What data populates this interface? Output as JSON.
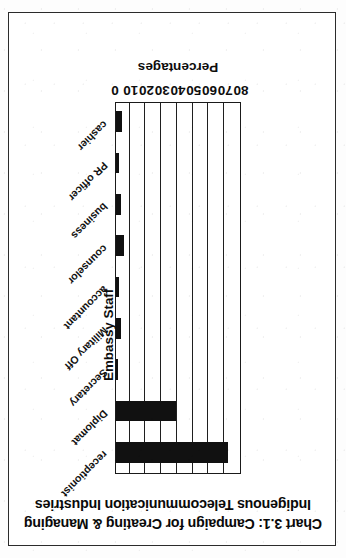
{
  "figure": {
    "caption_prefix": "Chart 3.1:",
    "title_line_1": "Chart 3.1: Campaign for Creating & Managing",
    "title_line_2": "Indigenous Telecommunication Industries",
    "orientation_note": "upside-down scan",
    "ink_color": "#111111",
    "frame_color": "#2b2b2b",
    "page_color": "#ffffff"
  },
  "chart_data": {
    "type": "bar",
    "title": "Chart 3.1: Campaign for Creating & Managing Indigenous Telecommunication Industries",
    "xlabel": "Embassy Staff",
    "ylabel": "Percentages",
    "ylim": [
      0,
      80
    ],
    "yticks": [
      0,
      10,
      20,
      30,
      40,
      50,
      60,
      70,
      80
    ],
    "ytick_labels": [
      "0",
      "10",
      "20",
      "30",
      "40",
      "50",
      "60",
      "70",
      "80"
    ],
    "grid": true,
    "legend": false,
    "orientation": "vertical",
    "categories": [
      "cashier",
      "PR officer",
      "business",
      "counselor",
      "accountant",
      "Military Off",
      "Secretary",
      "Diplomat",
      "receptionist"
    ],
    "values": [
      4,
      2,
      3,
      5,
      2,
      3,
      1,
      38,
      71
    ],
    "series": [
      {
        "name": "Percentages",
        "values": [
          4,
          2,
          3,
          5,
          2,
          3,
          1,
          38,
          71
        ],
        "color": "#111111"
      }
    ]
  }
}
